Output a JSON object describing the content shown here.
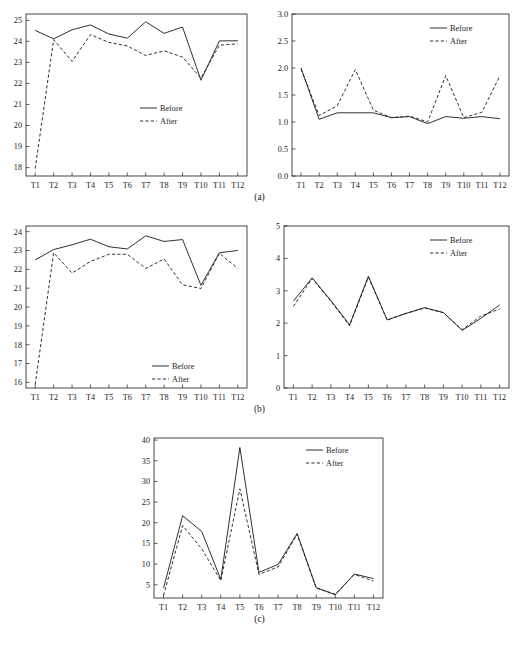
{
  "figure": {
    "panels": [
      {
        "label": "(a)"
      },
      {
        "label": "(b)"
      },
      {
        "label": "(c)"
      }
    ],
    "legend": {
      "before_label": "Before",
      "after_label": "After"
    },
    "categories": [
      "T1",
      "T2",
      "T3",
      "T4",
      "T5",
      "T6",
      "T7",
      "T8",
      "T9",
      "T10",
      "T11",
      "T12"
    ]
  },
  "chart_data": [
    {
      "id": "a-left",
      "type": "line",
      "title": "",
      "xlabel": "",
      "ylabel": "",
      "grid": false,
      "legend_position": "center-right",
      "categories": [
        "T1",
        "T2",
        "T3",
        "T4",
        "T5",
        "T6",
        "T7",
        "T8",
        "T9",
        "T10",
        "T11",
        "T12"
      ],
      "ylim": [
        17.6,
        25.3
      ],
      "yticks": [
        18,
        19,
        20,
        21,
        22,
        23,
        24,
        25
      ],
      "ytick_labels": [
        "18",
        "19",
        "20",
        "21",
        "22",
        "23",
        "24",
        "25"
      ],
      "series": [
        {
          "name": "Before",
          "style": "solid",
          "values": [
            24.52,
            24.12,
            24.55,
            24.78,
            24.35,
            24.15,
            24.93,
            24.38,
            24.68,
            22.15,
            24.02,
            24.03
          ]
        },
        {
          "name": "After",
          "style": "dashed",
          "values": [
            17.95,
            24.08,
            23.05,
            24.32,
            23.95,
            23.78,
            23.33,
            23.55,
            23.25,
            22.25,
            23.82,
            23.88
          ]
        }
      ]
    },
    {
      "id": "a-right",
      "type": "line",
      "title": "",
      "xlabel": "",
      "ylabel": "",
      "grid": false,
      "legend_position": "top-right",
      "categories": [
        "T1",
        "T2",
        "T3",
        "T4",
        "T5",
        "T6",
        "T7",
        "T8",
        "T9",
        "T10",
        "T11",
        "T12"
      ],
      "ylim": [
        0.0,
        3.0
      ],
      "yticks": [
        0.0,
        0.5,
        1.0,
        1.5,
        2.0,
        2.5,
        3.0
      ],
      "ytick_labels": [
        "0.0",
        "0.5",
        "1.0",
        "1.5",
        "2.0",
        "2.5",
        "3.0"
      ],
      "series": [
        {
          "name": "Before",
          "style": "solid",
          "values": [
            2.0,
            1.05,
            1.17,
            1.17,
            1.17,
            1.08,
            1.1,
            0.97,
            1.1,
            1.07,
            1.1,
            1.06
          ]
        },
        {
          "name": "After",
          "style": "dashed",
          "values": [
            1.98,
            1.12,
            1.3,
            1.97,
            1.22,
            1.08,
            1.11,
            1.0,
            1.86,
            1.08,
            1.18,
            1.86
          ]
        }
      ]
    },
    {
      "id": "b-left",
      "type": "line",
      "title": "",
      "xlabel": "",
      "ylabel": "",
      "grid": false,
      "legend_position": "bottom-right",
      "categories": [
        "T1",
        "T2",
        "T3",
        "T4",
        "T5",
        "T6",
        "T7",
        "T8",
        "T9",
        "T10",
        "T11",
        "T12"
      ],
      "ylim": [
        15.7,
        24.3
      ],
      "yticks": [
        16,
        17,
        18,
        19,
        20,
        21,
        22,
        23,
        24
      ],
      "ytick_labels": [
        "16",
        "17",
        "18",
        "19",
        "20",
        "21",
        "22",
        "23",
        "24"
      ],
      "series": [
        {
          "name": "Before",
          "style": "solid",
          "values": [
            22.5,
            23.05,
            23.3,
            23.6,
            23.2,
            23.08,
            23.78,
            23.48,
            23.58,
            21.15,
            22.88,
            23.0
          ]
        },
        {
          "name": "After",
          "style": "dashed",
          "values": [
            15.88,
            22.88,
            21.8,
            22.42,
            22.8,
            22.8,
            22.05,
            22.55,
            21.18,
            20.98,
            22.85,
            22.05
          ]
        }
      ]
    },
    {
      "id": "b-right",
      "type": "line",
      "title": "",
      "xlabel": "",
      "ylabel": "",
      "grid": false,
      "legend_position": "top-right",
      "categories": [
        "T1",
        "T2",
        "T3",
        "T4",
        "T5",
        "T6",
        "T7",
        "T8",
        "T9",
        "T10",
        "T11",
        "T12"
      ],
      "ylim": [
        0,
        5
      ],
      "yticks": [
        0,
        1,
        2,
        3,
        4,
        5
      ],
      "ytick_labels": [
        "0",
        "1",
        "2",
        "3",
        "4",
        "5"
      ],
      "series": [
        {
          "name": "Before",
          "style": "solid",
          "values": [
            2.68,
            3.4,
            2.7,
            1.95,
            3.45,
            2.1,
            2.3,
            2.48,
            2.33,
            1.78,
            2.15,
            2.56
          ]
        },
        {
          "name": "After",
          "style": "dashed",
          "values": [
            2.52,
            3.38,
            2.68,
            1.92,
            3.42,
            2.1,
            2.3,
            2.47,
            2.32,
            1.8,
            2.22,
            2.44
          ]
        }
      ]
    },
    {
      "id": "c",
      "type": "line",
      "title": "",
      "xlabel": "",
      "ylabel": "",
      "grid": false,
      "legend_position": "top-right",
      "categories": [
        "T1",
        "T2",
        "T3",
        "T4",
        "T5",
        "T6",
        "T7",
        "T8",
        "T9",
        "T10",
        "T11",
        "T12"
      ],
      "ylim": [
        1.8,
        40.5
      ],
      "yticks": [
        5,
        10,
        15,
        20,
        25,
        30,
        35,
        40
      ],
      "ytick_labels": [
        "5",
        "10",
        "15",
        "20",
        "25",
        "30",
        "35",
        "40"
      ],
      "series": [
        {
          "name": "Before",
          "style": "solid",
          "values": [
            4.2,
            21.7,
            17.9,
            6.3,
            38.2,
            8.0,
            9.9,
            17.4,
            4.3,
            2.6,
            7.6,
            6.5
          ]
        },
        {
          "name": "After",
          "style": "dashed",
          "values": [
            2.4,
            19.3,
            13.7,
            6.0,
            28.2,
            7.5,
            9.3,
            17.2,
            4.2,
            2.7,
            7.5,
            5.9
          ]
        }
      ]
    }
  ]
}
